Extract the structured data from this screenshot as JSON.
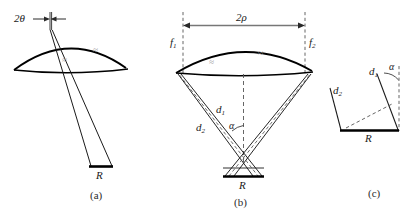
{
  "figure": {
    "kind": "three-panel-optics-geometry-diagram",
    "panels": [
      {
        "id": "a",
        "caption": "(a)",
        "labels": {
          "angle": "2θ",
          "base": "R"
        },
        "hatch_marks": [
          "≈",
          "≈"
        ]
      },
      {
        "id": "b",
        "caption": "(b)",
        "labels": {
          "width": "2ρ",
          "focus_left": "f",
          "focus_left_sub": "1",
          "focus_right": "f",
          "focus_right_sub": "2",
          "dist_inner": "d",
          "dist_inner_sub": "1",
          "dist_outer": "d",
          "dist_outer_sub": "2",
          "angle": "α",
          "base": "R"
        },
        "hatch_marks": [
          "≈",
          "≈"
        ]
      },
      {
        "id": "c",
        "caption": "(c)",
        "labels": {
          "dist_inner": "d",
          "dist_inner_sub": "1",
          "dist_outer": "d",
          "dist_outer_sub": "2",
          "angle": "α",
          "base": "R"
        }
      }
    ],
    "colors": {
      "stroke": "#000000",
      "thin_stroke": "#1a1a1a",
      "dim_line": "#6e6e6e",
      "dashed_line": "#555555",
      "hatch": "#9a9a9a",
      "text": "#1a1a1a",
      "background": "#ffffff"
    }
  }
}
